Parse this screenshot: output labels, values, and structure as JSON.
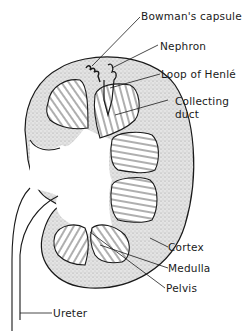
{
  "diagram": {
    "colors": {
      "line": "#1a1a1a",
      "cortex_fill": "#d9d9d9",
      "background": "#ffffff"
    },
    "labels": [
      {
        "id": "bowmans-capsule",
        "text": "Bowman's capsule"
      },
      {
        "id": "nephron",
        "text": "Nephron"
      },
      {
        "id": "loop-of-henle",
        "text": "Loop of Henlé"
      },
      {
        "id": "collecting-duct-line1",
        "text": "Collecting"
      },
      {
        "id": "collecting-duct-line2",
        "text": "duct"
      },
      {
        "id": "cortex",
        "text": "Cortex"
      },
      {
        "id": "medulla",
        "text": "Medulla"
      },
      {
        "id": "pelvis",
        "text": "Pelvis"
      },
      {
        "id": "ureter",
        "text": "Ureter"
      }
    ]
  }
}
